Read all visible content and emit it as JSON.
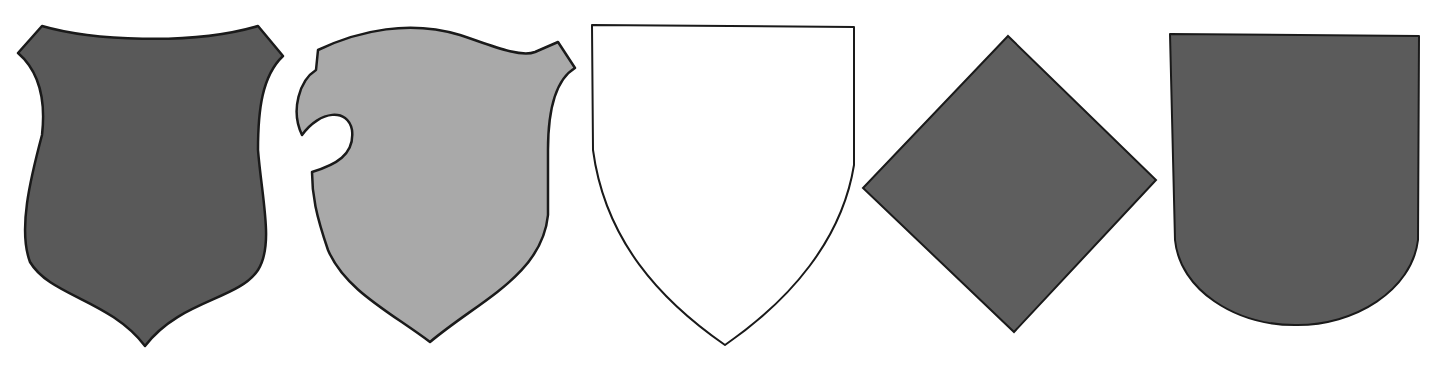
{
  "figure": {
    "background": "#ffffff",
    "outline_color": "#1a1a1a",
    "shields": [
      {
        "id": "heater-notched-dark",
        "description": "Dark shield with concave top and pointed cusp base",
        "fill": "#595959",
        "x": 0,
        "width": 300
      },
      {
        "id": "bouche-light",
        "description": "Light gray shield with a lance-rest notch (bouche) on the left",
        "fill": "#a9a9a9",
        "x": 280,
        "width": 310
      },
      {
        "id": "heater-plain",
        "description": "White outlined heater shield with flat top and pointed base",
        "fill": "#ffffff",
        "x": 580,
        "width": 290
      },
      {
        "id": "lozenge",
        "description": "Dark diamond-shaped lozenge",
        "fill": "#5e5e5e",
        "x": 850,
        "width": 320
      },
      {
        "id": "spanish-round",
        "description": "Dark shield with flat top and rounded base",
        "fill": "#5b5b5b",
        "x": 1150,
        "width": 288
      }
    ]
  }
}
